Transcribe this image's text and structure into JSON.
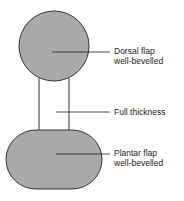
{
  "diagram": {
    "labels": {
      "dorsal_line1": "Dorsal flap",
      "dorsal_line2": "well-bevelled",
      "full": "Full thickness",
      "plantar_line1": "Plantar flap",
      "plantar_line2": "well-bevelled"
    },
    "colors": {
      "fill": "#a9a9a9",
      "stroke": "#333333"
    }
  }
}
